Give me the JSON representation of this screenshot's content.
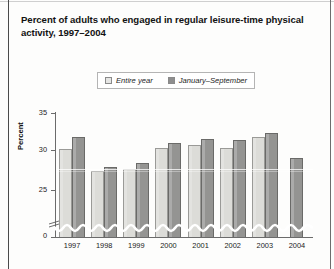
{
  "title": "Percent of adults who engaged in regular leisure-time physical activity, 1997–2004",
  "legend": {
    "items": [
      {
        "label": "Entire year",
        "swatch": "light-gray-square",
        "color": "#e6e6e4"
      },
      {
        "label": "January–September",
        "swatch": "dark-gray-square",
        "color": "#8e8e8e"
      }
    ]
  },
  "axes": {
    "y_title": "Percent",
    "y_ticks": [
      "0",
      "25",
      "30",
      "35"
    ],
    "x_ticks": [
      "1997",
      "1998",
      "1999",
      "2000",
      "2001",
      "2002",
      "2003",
      "2004"
    ],
    "has_axis_break": true
  },
  "chart_data": {
    "type": "bar",
    "title": "Percent of adults who engaged in regular leisure-time physical activity, 1997–2004",
    "xlabel": "",
    "ylabel": "Percent",
    "categories": [
      "1997",
      "1998",
      "1999",
      "2000",
      "2001",
      "2002",
      "2003",
      "2004"
    ],
    "series": [
      {
        "name": "Entire year",
        "color": "#e6e6e4",
        "values": [
          32.1,
          30.1,
          30.3,
          32.2,
          32.4,
          32.2,
          33.2,
          null
        ]
      },
      {
        "name": "January–September",
        "color": "#8e8e8e",
        "values": [
          33.2,
          30.5,
          30.8,
          32.6,
          33.0,
          32.9,
          33.5,
          31.3
        ]
      }
    ],
    "ylim": [
      24.2,
      35.4
    ],
    "ytick_values": [
      25,
      30,
      35
    ],
    "zero_tick_shown": true,
    "axis_break": "y-axis broken between 0 and 25",
    "grid": false,
    "legend_position": "top-center"
  }
}
